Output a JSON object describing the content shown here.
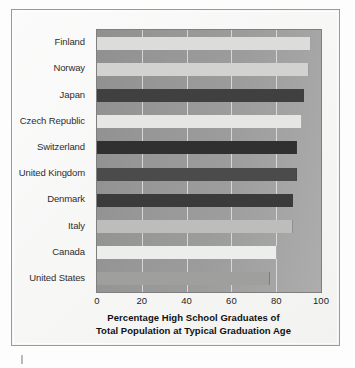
{
  "chart_data": {
    "type": "bar",
    "orientation": "horizontal",
    "title": "",
    "xlabel": "Percentage High School Graduates of Total Population at Typical Graduation Age",
    "ylabel": "",
    "xlim": [
      0,
      100
    ],
    "xticks": [
      "0",
      "20",
      "40",
      "60",
      "80",
      "100"
    ],
    "grid": true,
    "legend": false,
    "categories": [
      "Finland",
      "Norway",
      "Japan",
      "Czech Republic",
      "Switzerland",
      "United Kingdom",
      "Denmark",
      "Italy",
      "Canada",
      "United States"
    ],
    "values": [
      95,
      94,
      92,
      91,
      89,
      89,
      87,
      87,
      80,
      77
    ],
    "bar_colors": [
      "#dcdcda",
      "#d2d3d1",
      "#3f403f",
      "#e6e7e5",
      "#2f302f",
      "#4a4b4a",
      "#3a3b3a",
      "#bdbebc",
      "#eceeec",
      "#9fa09e"
    ]
  },
  "axis_title": {
    "line1": "Percentage High School Graduates of",
    "line2": "Total Population at Typical Graduation Age"
  }
}
